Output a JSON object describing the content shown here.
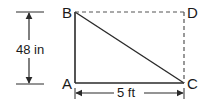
{
  "diagram": {
    "points": {
      "A": {
        "label": "A",
        "x": 74,
        "y": 83
      },
      "B": {
        "label": "B",
        "x": 74,
        "y": 12
      },
      "C": {
        "label": "C",
        "x": 184,
        "y": 83
      },
      "D": {
        "label": "D",
        "x": 184,
        "y": 12
      }
    },
    "dimensions": {
      "height": {
        "label": "48 in"
      },
      "width": {
        "label": "5 ft"
      }
    },
    "colors": {
      "line": "#2a2a2a",
      "dashed": "#555555",
      "background": "#ffffff"
    }
  }
}
